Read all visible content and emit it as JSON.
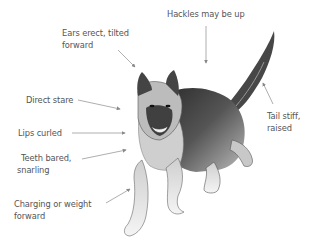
{
  "labels": {
    "hackles": "Hackles may be up",
    "ears_line1": "Ears erect, tilted",
    "ears_line2": "forward",
    "stare": "Direct stare",
    "lips": "Lips curled",
    "teeth_line1": "Teeth bared,",
    "teeth_line2": "snarling",
    "charging_line1": "Charging or weight",
    "charging_line2": "forward",
    "tail_line1": "Tail stiff,",
    "tail_line2": "raised"
  },
  "colors": {
    "text": "#555555",
    "arrow": "#888888",
    "fur_dark": "#1a1a1a",
    "fur_mid": "#6a6a6a",
    "fur_light": "#d8d8d8"
  }
}
